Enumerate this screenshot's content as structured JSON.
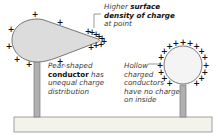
{
  "diagram": {
    "colors": {
      "conductor_fill": "#dcdcdc",
      "conductor_stroke": "#6a6a6a",
      "stand_fill": "#b0b0b0",
      "base_fill": "#f3f3ec",
      "charge": "#111111",
      "text": "#3a3a3a"
    },
    "charge_symbol": "+",
    "labels": {
      "point": {
        "pre": "Higher ",
        "bold1": "surface",
        "bold2": "density of charge",
        "post": "at point"
      },
      "pear": {
        "line1": "Pear-shaped",
        "bold": "conductor",
        "bold_tail": " has",
        "line3": "unequal charge",
        "line4": "distribution"
      },
      "hollow": {
        "line1": "Hollow",
        "line2": "charged",
        "line3": "conductors",
        "line4": "have no charge",
        "line5": "on inside"
      }
    }
  }
}
